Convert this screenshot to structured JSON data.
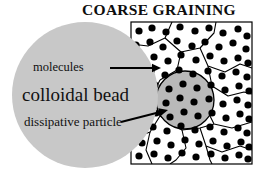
{
  "figure": {
    "title": "COARSE GRAINING",
    "labels": {
      "molecules": "molecules",
      "colloidal_bead": "colloidal bead",
      "dissipative_particle": "dissipative particle"
    },
    "colors": {
      "bead_fill": "#c8c8c8",
      "particle_fill": "#b9b9b9",
      "box_background": "#ffffff",
      "molecule_dot": "#000000",
      "outline": "#000000",
      "text": "#111111"
    },
    "geometry": {
      "box": {
        "x": 131,
        "y": 22,
        "width": 121,
        "height": 142
      },
      "colloidal_bead": {
        "cx": 85,
        "cy": 95,
        "r": 73
      },
      "dissipative_particle": {
        "cx": 185,
        "cy": 100,
        "r": 29
      }
    },
    "annotations": [
      {
        "name": "molecules-arrow",
        "from_x": 110,
        "from_y": 68,
        "to_x": 161,
        "to_y": 68
      },
      {
        "name": "dissipative-particle-arrow",
        "from_x": 121,
        "from_y": 122,
        "to_x": 168,
        "to_y": 110
      }
    ],
    "chart_data": {
      "type": "diagram",
      "title": "COARSE GRAINING",
      "description": "Left half shows a large grey colloidal bead; right half shows a boxed region of Voronoi cells filled with black molecule dots, one cell coarse-grained into a grey dissipative particle.",
      "molecule_dots": [
        [
          139,
          31
        ],
        [
          152,
          28
        ],
        [
          166,
          32
        ],
        [
          180,
          27
        ],
        [
          195,
          31
        ],
        [
          209,
          28
        ],
        [
          223,
          33
        ],
        [
          238,
          29
        ],
        [
          247,
          36
        ],
        [
          136,
          45
        ],
        [
          150,
          42
        ],
        [
          163,
          47
        ],
        [
          177,
          41
        ],
        [
          192,
          46
        ],
        [
          205,
          42
        ],
        [
          219,
          47
        ],
        [
          233,
          43
        ],
        [
          246,
          49
        ],
        [
          140,
          59
        ],
        [
          154,
          57
        ],
        [
          168,
          61
        ],
        [
          181,
          55
        ],
        [
          196,
          60
        ],
        [
          210,
          56
        ],
        [
          224,
          61
        ],
        [
          238,
          58
        ],
        [
          248,
          63
        ],
        [
          136,
          73
        ],
        [
          151,
          71
        ],
        [
          165,
          75
        ],
        [
          179,
          70
        ],
        [
          193,
          74
        ],
        [
          208,
          71
        ],
        [
          222,
          76
        ],
        [
          236,
          72
        ],
        [
          247,
          77
        ],
        [
          140,
          87
        ],
        [
          155,
          85
        ],
        [
          169,
          89
        ],
        [
          183,
          84
        ],
        [
          197,
          88
        ],
        [
          211,
          85
        ],
        [
          225,
          90
        ],
        [
          239,
          86
        ],
        [
          249,
          91
        ],
        [
          137,
          101
        ],
        [
          152,
          99
        ],
        [
          166,
          103
        ],
        [
          180,
          98
        ],
        [
          194,
          102
        ],
        [
          209,
          99
        ],
        [
          223,
          104
        ],
        [
          237,
          100
        ],
        [
          248,
          105
        ],
        [
          141,
          115
        ],
        [
          156,
          113
        ],
        [
          170,
          117
        ],
        [
          184,
          112
        ],
        [
          198,
          116
        ],
        [
          212,
          113
        ],
        [
          226,
          118
        ],
        [
          240,
          114
        ],
        [
          249,
          119
        ],
        [
          138,
          129
        ],
        [
          153,
          127
        ],
        [
          167,
          131
        ],
        [
          181,
          126
        ],
        [
          195,
          130
        ],
        [
          210,
          127
        ],
        [
          224,
          132
        ],
        [
          238,
          128
        ],
        [
          247,
          133
        ],
        [
          142,
          143
        ],
        [
          157,
          141
        ],
        [
          171,
          145
        ],
        [
          185,
          140
        ],
        [
          199,
          144
        ],
        [
          213,
          141
        ],
        [
          227,
          146
        ],
        [
          241,
          142
        ],
        [
          249,
          147
        ],
        [
          139,
          156
        ],
        [
          154,
          154
        ],
        [
          168,
          158
        ],
        [
          182,
          153
        ],
        [
          196,
          157
        ],
        [
          211,
          154
        ],
        [
          225,
          158
        ],
        [
          239,
          155
        ],
        [
          248,
          159
        ]
      ],
      "cell_edges": [
        [
          [
            172,
            22
          ],
          [
            165,
            38
          ],
          [
            148,
            46
          ],
          [
            131,
            44
          ]
        ],
        [
          [
            165,
            38
          ],
          [
            181,
            52
          ],
          [
            177,
            70
          ],
          [
            160,
            80
          ]
        ],
        [
          [
            181,
            52
          ],
          [
            200,
            48
          ],
          [
            214,
            33
          ],
          [
            216,
            22
          ]
        ],
        [
          [
            200,
            48
          ],
          [
            208,
            66
          ],
          [
            225,
            72
          ],
          [
            240,
            64
          ],
          [
            252,
            68
          ]
        ],
        [
          [
            160,
            80
          ],
          [
            152,
            96
          ],
          [
            131,
            100
          ]
        ],
        [
          [
            208,
            66
          ],
          [
            212,
            86
          ],
          [
            228,
            96
          ],
          [
            244,
            92
          ],
          [
            252,
            94
          ]
        ],
        [
          [
            212,
            86
          ],
          [
            205,
            106
          ],
          [
            214,
            124
          ],
          [
            232,
            128
          ],
          [
            252,
            122
          ]
        ],
        [
          [
            152,
            96
          ],
          [
            160,
            116
          ],
          [
            150,
            132
          ],
          [
            134,
            138
          ],
          [
            131,
            140
          ]
        ],
        [
          [
            160,
            116
          ],
          [
            182,
            130
          ],
          [
            200,
            128
          ],
          [
            214,
            124
          ]
        ],
        [
          [
            182,
            130
          ],
          [
            186,
            148
          ],
          [
            176,
            160
          ],
          [
            170,
            164
          ]
        ],
        [
          [
            200,
            128
          ],
          [
            206,
            146
          ],
          [
            222,
            152
          ],
          [
            240,
            146
          ],
          [
            252,
            150
          ]
        ],
        [
          [
            150,
            132
          ],
          [
            146,
            150
          ],
          [
            152,
            164
          ]
        ],
        [
          [
            206,
            146
          ],
          [
            210,
            160
          ],
          [
            212,
            164
          ]
        ]
      ]
    }
  }
}
